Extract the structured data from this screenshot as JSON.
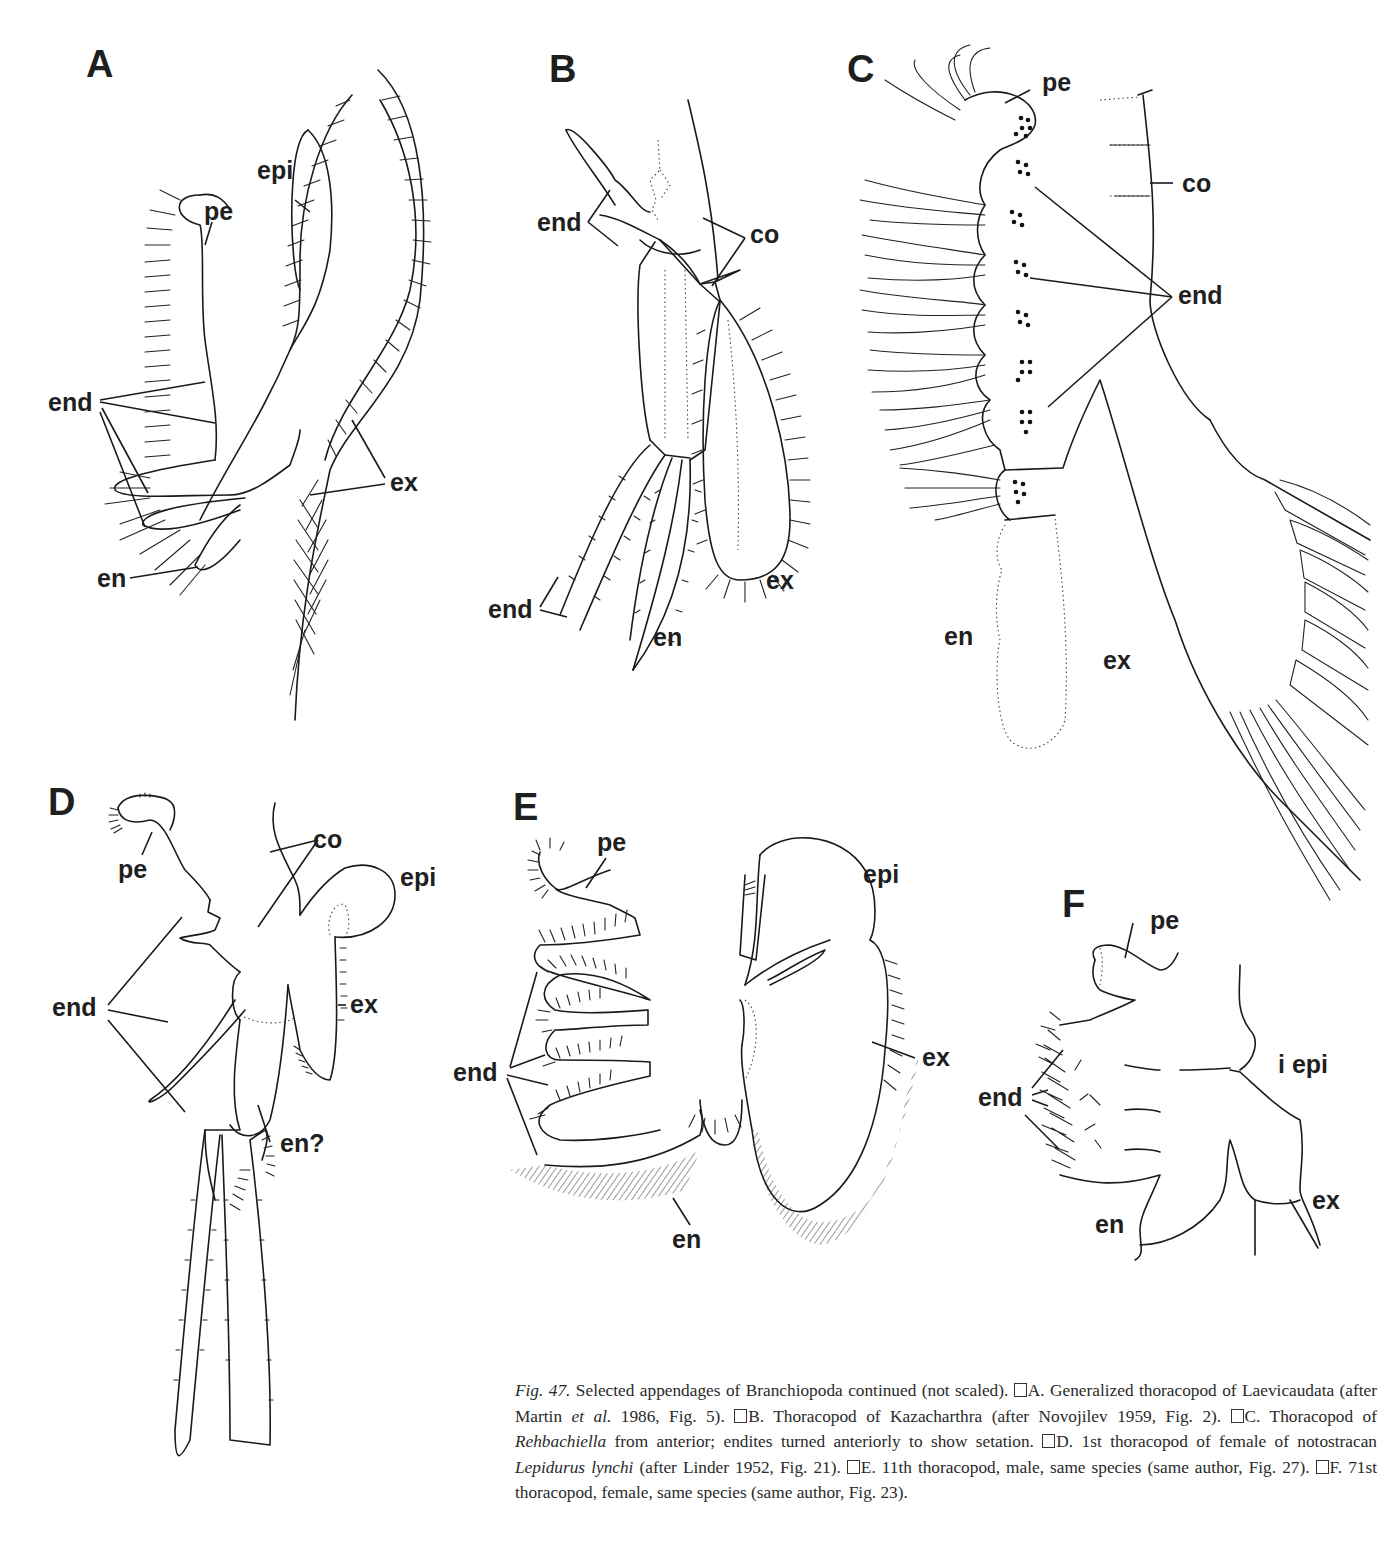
{
  "figure": {
    "number": "Fig. 47.",
    "panels": [
      {
        "id": "A",
        "letter": "A",
        "labels": {
          "pe": "pe",
          "epi": "epi",
          "end": "end",
          "ex": "ex",
          "en": "en"
        }
      },
      {
        "id": "B",
        "letter": "B",
        "labels": {
          "end_top": "end",
          "co": "co",
          "end_bottom": "end",
          "en": "en",
          "ex": "ex"
        }
      },
      {
        "id": "C",
        "letter": "C",
        "labels": {
          "pe": "pe",
          "co": "co",
          "end": "end",
          "en": "en",
          "ex": "ex"
        }
      },
      {
        "id": "D",
        "letter": "D",
        "labels": {
          "pe": "pe",
          "co": "co",
          "epi": "epi",
          "end": "end",
          "ex": "ex",
          "en": "en?"
        }
      },
      {
        "id": "E",
        "letter": "E",
        "labels": {
          "pe": "pe",
          "epi": "epi",
          "end": "end",
          "ex": "ex",
          "en": "en"
        }
      },
      {
        "id": "F",
        "letter": "F",
        "labels": {
          "pe": "pe",
          "i_epi": "i epi",
          "end": "end",
          "en": "en",
          "ex": "ex"
        }
      }
    ]
  },
  "caption": {
    "fig_label": "Fig. 47.",
    "intro": " Selected appendages of Branchiopoda continued (not scaled). ",
    "A": "A. Generalized thoracopod of Laevicaudata (after Martin ",
    "A_etal": "et al.",
    "A_tail": " 1986, Fig. 5). ",
    "B": "B. Thoracopod of Kazacharthra (after Novojilev 1959, Fig. 2). ",
    "C_head": "C. Thoracopod of ",
    "C_taxon": "Rehbachiella",
    "C_tail": " from anterior; endites turned anteriorly to show setation. ",
    "D_head": "D. 1st thoracopod of female of notostracan ",
    "D_taxon": "Lepidurus lynchi",
    "D_tail": " (after Linder 1952, Fig. 21). ",
    "E": "E. 11th thoracopod, male, same species (same author, Fig. 27). ",
    "F": "F. 71st thoracopod, female, same species (same author, Fig. 23)."
  }
}
